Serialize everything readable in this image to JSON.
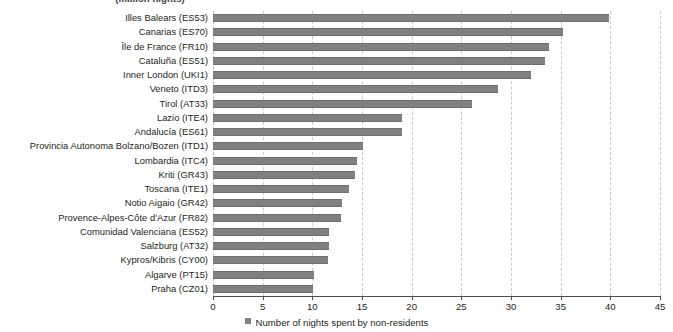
{
  "chart_data": {
    "type": "bar",
    "orientation": "horizontal",
    "title": "(million nights)",
    "xlabel": "",
    "ylabel": "",
    "xlim": [
      0,
      45
    ],
    "xticks": [
      0,
      5,
      10,
      15,
      20,
      25,
      30,
      35,
      40,
      45
    ],
    "grid": true,
    "legend_position": "bottom",
    "legend": [
      "Number of nights spent by non-residents"
    ],
    "series_color": "#808080",
    "categories": [
      "Illes Balears (ES53)",
      "Canarias (ES70)",
      "Île de France (FR10)",
      "Cataluña (ES51)",
      "Inner London (UKI1)",
      "Veneto (ITD3)",
      "Tirol (AT33)",
      "Lazio (ITE4)",
      "Andalucía (ES61)",
      "Provincia Autonoma Bolzano/Bozen (ITD1)",
      "Lombardia (ITC4)",
      "Kriti (GR43)",
      "Toscana (ITE1)",
      "Notio Aigaio (GR42)",
      "Provence-Alpes-Côte d'Azur (FR82)",
      "Comunidad Valenciana (ES52)",
      "Salzburg (AT32)",
      "Kypros/Kibris (CY00)",
      "Algarve (PT15)",
      "Praha (CZ01)"
    ],
    "series": [
      {
        "name": "Number of nights spent by non-residents",
        "values": [
          39.9,
          35.2,
          33.8,
          33.4,
          32.0,
          28.7,
          26.1,
          19.0,
          19.0,
          15.1,
          14.5,
          14.3,
          13.7,
          13.0,
          12.9,
          11.7,
          11.7,
          11.6,
          10.2,
          10.1
        ]
      }
    ]
  }
}
